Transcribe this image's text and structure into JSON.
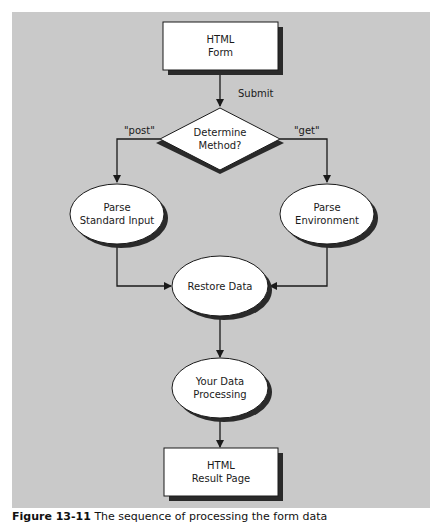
{
  "diagram": {
    "type": "flowchart",
    "background_color": "#c9c9c9",
    "node_fill": "#ffffff",
    "shadow_color": "#2a2a2a",
    "nodes": {
      "html_form": {
        "shape": "rectangle",
        "line1": "HTML",
        "line2": "Form"
      },
      "determine_method": {
        "shape": "diamond",
        "line1": "Determine",
        "line2": "Method?"
      },
      "parse_stdin": {
        "shape": "ellipse",
        "line1": "Parse",
        "line2": "Standard Input"
      },
      "parse_env": {
        "shape": "ellipse",
        "line1": "Parse",
        "line2": "Environment"
      },
      "restore_data": {
        "shape": "ellipse",
        "line1": "Restore Data"
      },
      "your_processing": {
        "shape": "ellipse",
        "line1": "Your Data",
        "line2": "Processing"
      },
      "result_page": {
        "shape": "rectangle",
        "line1": "HTML",
        "line2": "Result Page"
      }
    },
    "edges": [
      {
        "from": "html_form",
        "to": "determine_method",
        "label": "Submit"
      },
      {
        "from": "determine_method",
        "to": "parse_stdin",
        "label": "\"post\""
      },
      {
        "from": "determine_method",
        "to": "parse_env",
        "label": "\"get\""
      },
      {
        "from": "parse_stdin",
        "to": "restore_data",
        "label": ""
      },
      {
        "from": "parse_env",
        "to": "restore_data",
        "label": ""
      },
      {
        "from": "restore_data",
        "to": "your_processing",
        "label": ""
      },
      {
        "from": "your_processing",
        "to": "result_page",
        "label": ""
      }
    ],
    "labels": {
      "submit": "Submit",
      "post": "\"post\"",
      "get": "\"get\""
    }
  },
  "caption": {
    "number": "Figure 13-11",
    "text": "The sequence of processing the form data"
  }
}
